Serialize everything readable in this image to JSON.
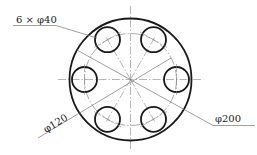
{
  "drawing": {
    "type": "flange-plate-top-view",
    "center": {
      "x": 130.5,
      "y": 79.5
    },
    "outer_circle_radius_px": 61,
    "bolt_circle_radius_px": 46,
    "hole_radius_px": 12.5,
    "hole_count": 6,
    "hole_angles_deg": [
      0,
      60,
      120,
      180,
      240,
      300
    ],
    "colors": {
      "outline": "#1a1a1a",
      "thin_line": "#777777",
      "center_line": "#888888",
      "text": "#222222",
      "background": "#ffffff"
    }
  },
  "dimensions": {
    "holes": {
      "label": "6 × φ40"
    },
    "bolt_circle": {
      "label": "φ120"
    },
    "outer_diameter": {
      "label": "φ200"
    }
  }
}
